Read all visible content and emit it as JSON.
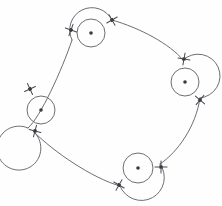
{
  "diagram": {
    "type": "directed-cycle-with-self-loops",
    "canvas": {
      "width": 222,
      "height": 206,
      "background": "#fefefe"
    },
    "style": {
      "line_color": "#6e6e74",
      "marker_color": "#4a4a50",
      "dot_color": "#3a3a40",
      "stroke_width": 1
    },
    "nodes": [
      {
        "id": "node-top",
        "label": "",
        "cx": 91,
        "cy": 33,
        "r": 14,
        "inner_dot_r": 1.8,
        "loop_r": 22,
        "position": "top"
      },
      {
        "id": "node-right",
        "label": "",
        "cx": 185,
        "cy": 82,
        "r": 14,
        "inner_dot_r": 1.8,
        "loop_r": 22,
        "position": "right"
      },
      {
        "id": "node-bottom",
        "label": "",
        "cx": 138,
        "cy": 168,
        "r": 15,
        "inner_dot_r": 1.8,
        "loop_r": 23,
        "position": "bottom"
      },
      {
        "id": "node-left",
        "label": "",
        "cx": 41,
        "cy": 110,
        "r": 14,
        "inner_dot_r": 1.8,
        "loop_r": 22,
        "position": "left"
      }
    ],
    "edges": [
      {
        "id": "edge-left-to-top",
        "from": "node-left",
        "to": "node-top",
        "path": "M 28 128 C 40 118 62 70 72 40",
        "curvature": "concave-outward"
      },
      {
        "id": "edge-top-to-right",
        "from": "node-top",
        "to": "node-right",
        "path": "M 112 20 C 140 28 170 44 183 60",
        "curvature": "concave-outward"
      },
      {
        "id": "edge-right-to-bottom",
        "from": "node-right",
        "to": "node-bottom",
        "path": "M 200 98 C 196 126 178 152 160 164",
        "curvature": "concave-outward"
      },
      {
        "id": "edge-bottom-to-left",
        "from": "node-bottom",
        "to": "node-left",
        "path": "M 120 186 C 92 178 54 152 34 132",
        "curvature": "concave-outward"
      }
    ],
    "node_loops": [
      {
        "id": "loop-top",
        "node": "node-top",
        "path": "M 72 40 A 22 22 0 1 1 112 20",
        "direction": "counterclockwise"
      },
      {
        "id": "loop-right",
        "node": "node-right",
        "path": "M 183 60 A 22 22 0 1 1 200 98",
        "direction": "counterclockwise"
      },
      {
        "id": "loop-bottom",
        "node": "node-bottom",
        "path": "M 160 164 A 23 23 0 1 1 120 186",
        "direction": "counterclockwise"
      },
      {
        "id": "loop-left",
        "node": "node-left",
        "path": "M 34 132 A 22 22 0 1 1 28 128",
        "direction": "counterclockwise"
      }
    ],
    "markers": [
      {
        "id": "marker-top-left",
        "x": 71,
        "y": 30,
        "size": 6,
        "rotation": 20,
        "on_node": "node-top"
      },
      {
        "id": "marker-top-right",
        "x": 112,
        "y": 20,
        "size": 6,
        "rotation": -30,
        "on_node": "node-top"
      },
      {
        "id": "marker-right-top",
        "x": 184,
        "y": 59,
        "size": 6,
        "rotation": 10,
        "on_node": "node-right"
      },
      {
        "id": "marker-right-bottom",
        "x": 200,
        "y": 100,
        "size": 6,
        "rotation": 40,
        "on_node": "node-right"
      },
      {
        "id": "marker-bottom-right",
        "x": 161,
        "y": 167,
        "size": 6,
        "rotation": 0,
        "on_node": "node-bottom"
      },
      {
        "id": "marker-bottom-left",
        "x": 119,
        "y": 185,
        "size": 6,
        "rotation": 30,
        "on_node": "node-bottom"
      },
      {
        "id": "marker-left-top",
        "x": 30,
        "y": 89,
        "size": 6,
        "rotation": -25,
        "on_node": "node-left"
      },
      {
        "id": "marker-left-bottom",
        "x": 35,
        "y": 131,
        "size": 6,
        "rotation": 15,
        "on_node": "node-left"
      }
    ]
  }
}
